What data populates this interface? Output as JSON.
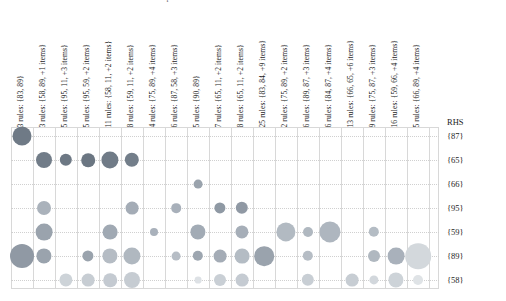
{
  "chart_data": {
    "type": "scatter",
    "subtype": "balloon-matrix",
    "title": "Grouped Matrix for 128 Rules",
    "xlabel": "",
    "ylabel": "RHS",
    "grid": true,
    "legend": "none",
    "size_encodes": "support",
    "color_encodes": "lift",
    "categories": [
      "3 rules: {83, 89}",
      "3 rules: {58, 89, +1 items}",
      "5 rules: {95, 11, +3 items}",
      "5 rules: {95, 59, +2 items}",
      "11 rules: {58, 11, +2 items}",
      "8 rules: {59, 11, +2 items}",
      "4 rules: {75, 89, +4 items}",
      "6 rules: {87, 58, +3 items}",
      "5 rules: {90, 89}",
      "7 rules: {65, 11, +2 items}",
      "8 rules: {65, 11, +2 items}",
      "25 rules: {83, 84, +9 items}",
      "2 rules: {75, 89, +2 items}",
      "6 rules: {89, 87, +3 items}",
      "6 rules: {84, 87, +4 items}",
      "13 rules: {66, 65, +6 items}",
      "9 rules: {75, 87, +3 items}",
      "16 rules: {59, 66, +4 items}",
      "5 rules: {66, 89, +4 items}"
    ],
    "rows": [
      "{87}",
      "{65}",
      "{66}",
      "{95}",
      "{59}",
      "{89}",
      "{58}"
    ],
    "rhs_header": "RHS",
    "points": [
      {
        "col": 0,
        "row": 0,
        "r": 9.5,
        "color": "#6f7a86"
      },
      {
        "col": 1,
        "row": 1,
        "r": 8.0,
        "color": "#717c88"
      },
      {
        "col": 2,
        "row": 1,
        "r": 6.2,
        "color": "#6d7884"
      },
      {
        "col": 3,
        "row": 1,
        "r": 6.8,
        "color": "#6b7682"
      },
      {
        "col": 4,
        "row": 1,
        "r": 8.6,
        "color": "#707b87"
      },
      {
        "col": 5,
        "row": 1,
        "r": 7.2,
        "color": "#737e8a"
      },
      {
        "col": 8,
        "row": 2,
        "r": 4.4,
        "color": "#9aa3ad"
      },
      {
        "col": 1,
        "row": 3,
        "r": 7.0,
        "color": "#aab2bb"
      },
      {
        "col": 5,
        "row": 3,
        "r": 6.4,
        "color": "#a4acb6"
      },
      {
        "col": 7,
        "row": 3,
        "r": 4.8,
        "color": "#a8b0ba"
      },
      {
        "col": 9,
        "row": 3,
        "r": 5.6,
        "color": "#8f99a4"
      },
      {
        "col": 10,
        "row": 3,
        "r": 6.2,
        "color": "#9099a4"
      },
      {
        "col": 1,
        "row": 4,
        "r": 8.4,
        "color": "#9aa3ad"
      },
      {
        "col": 4,
        "row": 4,
        "r": 7.4,
        "color": "#a0a9b3"
      },
      {
        "col": 6,
        "row": 4,
        "r": 4.0,
        "color": "#a9b1bb"
      },
      {
        "col": 8,
        "row": 4,
        "r": 7.6,
        "color": "#a2abb5"
      },
      {
        "col": 10,
        "row": 4,
        "r": 6.6,
        "color": "#a6aeb8"
      },
      {
        "col": 12,
        "row": 4,
        "r": 9.6,
        "color": "#b2bac2"
      },
      {
        "col": 13,
        "row": 4,
        "r": 5.0,
        "color": "#b0b8c0"
      },
      {
        "col": 14,
        "row": 4,
        "r": 10.6,
        "color": "#aeb6bf"
      },
      {
        "col": 16,
        "row": 4,
        "r": 5.2,
        "color": "#b4bcc4"
      },
      {
        "col": 0,
        "row": 5,
        "r": 12.0,
        "color": "#9099a4"
      },
      {
        "col": 1,
        "row": 5,
        "r": 7.6,
        "color": "#9aa3ad"
      },
      {
        "col": 3,
        "row": 5,
        "r": 5.6,
        "color": "#9aa3ad"
      },
      {
        "col": 4,
        "row": 5,
        "r": 7.6,
        "color": "#b5bcc4"
      },
      {
        "col": 5,
        "row": 5,
        "r": 8.6,
        "color": "#b0b8c0"
      },
      {
        "col": 7,
        "row": 5,
        "r": 4.4,
        "color": "#b6bdc5"
      },
      {
        "col": 8,
        "row": 5,
        "r": 5.2,
        "color": "#9da6b0"
      },
      {
        "col": 9,
        "row": 5,
        "r": 6.4,
        "color": "#a4acb6"
      },
      {
        "col": 10,
        "row": 5,
        "r": 7.4,
        "color": "#b4bcc4"
      },
      {
        "col": 11,
        "row": 5,
        "r": 9.8,
        "color": "#9aa3ad"
      },
      {
        "col": 13,
        "row": 5,
        "r": 5.2,
        "color": "#b6bdc5"
      },
      {
        "col": 16,
        "row": 5,
        "r": 6.0,
        "color": "#b0b8c0"
      },
      {
        "col": 17,
        "row": 5,
        "r": 8.4,
        "color": "#a9b1bb"
      },
      {
        "col": 18,
        "row": 5,
        "r": 12.8,
        "color": "#d3d8dc"
      },
      {
        "col": 2,
        "row": 6,
        "r": 6.6,
        "color": "#cdd3d8"
      },
      {
        "col": 3,
        "row": 6,
        "r": 6.4,
        "color": "#c7cdd3"
      },
      {
        "col": 4,
        "row": 6,
        "r": 6.8,
        "color": "#c4cad1"
      },
      {
        "col": 5,
        "row": 6,
        "r": 8.0,
        "color": "#c6ccd2"
      },
      {
        "col": 8,
        "row": 6,
        "r": 3.4,
        "color": "#dde1e5"
      },
      {
        "col": 9,
        "row": 6,
        "r": 6.0,
        "color": "#c9cfd5"
      },
      {
        "col": 10,
        "row": 6,
        "r": 6.4,
        "color": "#c5cbd2"
      },
      {
        "col": 13,
        "row": 6,
        "r": 6.2,
        "color": "#c8ced4"
      },
      {
        "col": 15,
        "row": 6,
        "r": 6.4,
        "color": "#c7cdd3"
      },
      {
        "col": 16,
        "row": 6,
        "r": 4.6,
        "color": "#d2d7dc"
      },
      {
        "col": 17,
        "row": 6,
        "r": 7.6,
        "color": "#cdd3d8"
      },
      {
        "col": 18,
        "row": 6,
        "r": 5.0,
        "color": "#dfe3e6"
      }
    ]
  },
  "layout": {
    "origin_x": 22,
    "origin_y": 136,
    "col_step": 22.0,
    "row_step": 24.0,
    "frame_left": 11,
    "frame_top": 127,
    "frame_width": 428,
    "frame_height": 162,
    "labels_x": 447,
    "rhs_title_y": 117
  }
}
